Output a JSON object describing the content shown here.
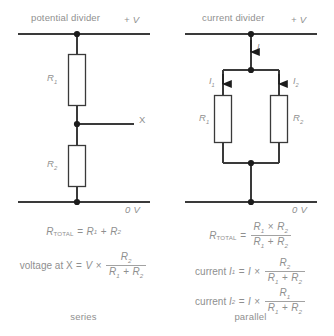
{
  "figure": {
    "background": "#ffffff",
    "line_color": "#3a3a3a",
    "text_color": "#8f8f8f"
  },
  "left": {
    "title": "potential divider",
    "caption": "series",
    "rail_top_label": "+ V",
    "rail_bottom_label": "0 V",
    "output_node_label": "X",
    "resistors": [
      {
        "label": "R",
        "sub": "1"
      },
      {
        "label": "R",
        "sub": "2"
      }
    ],
    "equations": {
      "total": {
        "lhs_main": "R",
        "lhs_sub": "TOTAL",
        "eq": "=",
        "term1": "R",
        "term1_sub": "1",
        "plus": "+",
        "term2": "R",
        "term2_sub": "2"
      },
      "voltage": {
        "prefix": "voltage at X",
        "eq": "=",
        "source": "V",
        "times": "×",
        "numerator": "R",
        "numerator_sub": "2",
        "den_a": "R",
        "den_a_sub": "1",
        "den_plus": "+",
        "den_b": "R",
        "den_b_sub": "2"
      }
    }
  },
  "right": {
    "title": "current divider",
    "caption": "parallel",
    "rail_top_label": "+ V",
    "rail_bottom_label": "0 V",
    "currents": [
      {
        "label": "I",
        "sub": ""
      },
      {
        "label": "I",
        "sub": "1"
      },
      {
        "label": "I",
        "sub": "2"
      }
    ],
    "resistors": [
      {
        "label": "R",
        "sub": "1"
      },
      {
        "label": "R",
        "sub": "2"
      }
    ],
    "equations": {
      "total": {
        "lhs_main": "R",
        "lhs_sub": "TOTAL",
        "eq": "=",
        "num_a": "R",
        "num_a_sub": "1",
        "num_times": "×",
        "num_b": "R",
        "num_b_sub": "2",
        "den_a": "R",
        "den_a_sub": "1",
        "den_plus": "+",
        "den_b": "R",
        "den_b_sub": "2"
      },
      "current1": {
        "prefix": "current",
        "lhs_main": "I",
        "lhs_sub": "1",
        "eq": "=",
        "source": "I",
        "times": "×",
        "numerator": "R",
        "numerator_sub": "2",
        "den_a": "R",
        "den_a_sub": "1",
        "den_plus": "+",
        "den_b": "R",
        "den_b_sub": "2"
      },
      "current2": {
        "prefix": "current",
        "lhs_main": "I",
        "lhs_sub": "2",
        "eq": "=",
        "source": "I",
        "times": "×",
        "numerator": "R",
        "numerator_sub": "1",
        "den_a": "R",
        "den_a_sub": "1",
        "den_plus": "+",
        "den_b": "R",
        "den_b_sub": "2"
      }
    }
  }
}
